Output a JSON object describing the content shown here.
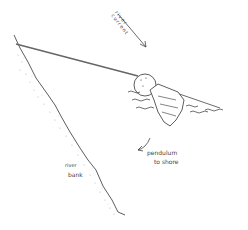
{
  "labels": {
    "river_current": [
      "river",
      "current"
    ],
    "pendulum": [
      "pendulum",
      "to shore"
    ],
    "river_bank": [
      "river",
      "bank"
    ]
  },
  "colors": {
    "ink": "#333333",
    "rope": "#666666",
    "stipple": "#aaaaaa",
    "background": "#ffffff"
  }
}
